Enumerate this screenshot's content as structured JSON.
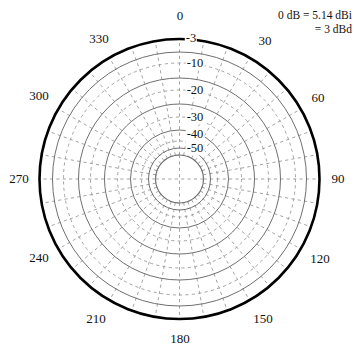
{
  "chart_data": {
    "type": "line",
    "chart_subtype": "polar-radiation-pattern",
    "title": "",
    "subtitle": "",
    "xlabel": "",
    "ylabel": "",
    "grid": true,
    "legend_position": "none",
    "reference_note": {
      "line1": "0 dB = 5.14 dBi",
      "line2": "= 3 dBd",
      "reference_db": 0,
      "dbi_value": 5.14,
      "dbd_value": 3
    },
    "angular_axis": {
      "unit": "degrees",
      "direction": "clockwise",
      "zero_at": "top",
      "range": [
        0,
        360
      ],
      "major_tick_step": 30,
      "minor_tick_step": 10,
      "tick_labels": [
        "0",
        "30",
        "60",
        "90",
        "120",
        "150",
        "180",
        "210",
        "240",
        "270",
        "300",
        "330"
      ],
      "tick_values": [
        0,
        30,
        60,
        90,
        120,
        150,
        180,
        210,
        240,
        270,
        300,
        330
      ]
    },
    "radial_axis": {
      "unit": "dB",
      "outer_value": 0,
      "center_value": -60,
      "tick_labels": [
        "-3",
        "-10",
        "-20",
        "-30",
        "-40",
        "-50"
      ],
      "tick_values": [
        -3,
        -10,
        -20,
        -30,
        -40,
        -50
      ],
      "solid_ring_values": [
        -10,
        -20,
        -30,
        -40,
        -50
      ],
      "dashed_ring_values": [
        -3,
        -5,
        -15,
        -25,
        -35,
        -45
      ],
      "scale": "logarithmic-compressed"
    },
    "series": [
      {
        "name": "Radiation pattern (0 dB circle)",
        "description": "Omnidirectional pattern: constant 0 dB at all azimuth angles",
        "style": "solid-thick",
        "color": "#000000",
        "angles": [
          0,
          30,
          60,
          90,
          120,
          150,
          180,
          210,
          240,
          270,
          300,
          330
        ],
        "values": [
          0,
          0,
          0,
          0,
          0,
          0,
          0,
          0,
          0,
          0,
          0,
          0
        ]
      }
    ],
    "annotations": [
      {
        "text": "0 dB = 5.14 dBi",
        "position": "top-right"
      },
      {
        "text": "= 3 dBd",
        "position": "top-right"
      }
    ]
  },
  "geometry": {
    "center_x": 179.5,
    "center_y": 179.0,
    "outer_radius": 140,
    "hub_radius": 24,
    "ring_radii": [
      140,
      127,
      116,
      101,
      89,
      75,
      62,
      49,
      38,
      31,
      24
    ],
    "label_radius_offsets": [
      157,
      152
    ]
  },
  "colors": {
    "background": "#ffffff",
    "pattern": "#000000",
    "solid_grid": "#6f6f6f",
    "dashed_grid": "#9a9a9a",
    "text": "#111111"
  },
  "angle_labels": [
    {
      "text": "0",
      "x": 180,
      "y": 16
    },
    {
      "text": "30",
      "x": 265,
      "y": 41
    },
    {
      "text": "60",
      "x": 318,
      "y": 98
    },
    {
      "text": "90",
      "x": 338,
      "y": 179
    },
    {
      "text": "120",
      "x": 320,
      "y": 259
    },
    {
      "text": "150",
      "x": 263,
      "y": 319
    },
    {
      "text": "180",
      "x": 180,
      "y": 339
    },
    {
      "text": "210",
      "x": 96,
      "y": 319
    },
    {
      "text": "240",
      "x": 39,
      "y": 258
    },
    {
      "text": "270",
      "x": 19,
      "y": 179
    },
    {
      "text": "300",
      "x": 39,
      "y": 96
    },
    {
      "text": "330",
      "x": 99,
      "y": 39
    }
  ],
  "ring_labels": [
    {
      "text": "-3",
      "x": 191,
      "y": 38
    },
    {
      "text": "-10",
      "x": 195,
      "y": 63
    },
    {
      "text": "-20",
      "x": 195,
      "y": 90
    },
    {
      "text": "-30",
      "x": 195,
      "y": 117
    },
    {
      "text": "-40",
      "x": 195,
      "y": 134
    },
    {
      "text": "-50",
      "x": 195,
      "y": 148
    }
  ],
  "annotation": {
    "line1": "0 dB = 5.14 dBi",
    "line2": "= 3 dBd"
  }
}
